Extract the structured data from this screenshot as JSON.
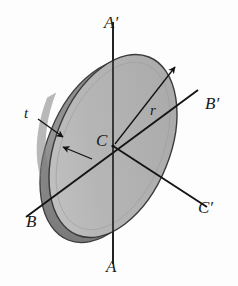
{
  "figure": {
    "type": "engineering-diagram",
    "background_color": "#fdfdfd",
    "colors": {
      "disk_face": "#b2b2b2",
      "disk_face_light": "#c2c2c2",
      "disk_face_dark": "#a0a0a0",
      "disk_rim": "#8d8d8d",
      "disk_rim_dark": "#7b7b7b",
      "outline": "#3a3a3a",
      "axis_line": "#1a1a1a",
      "label_text": "#1a1a1a"
    }
  },
  "labels": {
    "axis_a_top": "A′",
    "axis_a_bottom": "A",
    "axis_b_right": "B′",
    "axis_b_left": "B",
    "axis_c_right": "C′",
    "center": "C",
    "radius": "r",
    "thickness": "t"
  },
  "geometry": {
    "disk_center": {
      "x": 113,
      "y": 146
    },
    "disk_radius_major": 96,
    "disk_radius_minor": 57,
    "disk_rotation_deg": -68,
    "thickness_offset": {
      "x": -9,
      "y": 5
    },
    "axis_a": {
      "x1": 113,
      "y1": 22,
      "x2": 113,
      "y2": 264
    },
    "axis_b": {
      "x1": 28,
      "y1": 216,
      "x2": 196,
      "y2": 92
    },
    "axis_c": {
      "x1": 113,
      "y1": 146,
      "x2": 206,
      "y2": 206
    },
    "radius_arrow": {
      "x1": 115,
      "y1": 144,
      "x2": 176,
      "y2": 66
    },
    "thickness_arrow_1": {
      "x1": 40,
      "y1": 120,
      "x2": 63,
      "y2": 137
    },
    "thickness_arrow_2": {
      "x1": 90,
      "y1": 158,
      "x2": 62,
      "y2": 146
    }
  }
}
